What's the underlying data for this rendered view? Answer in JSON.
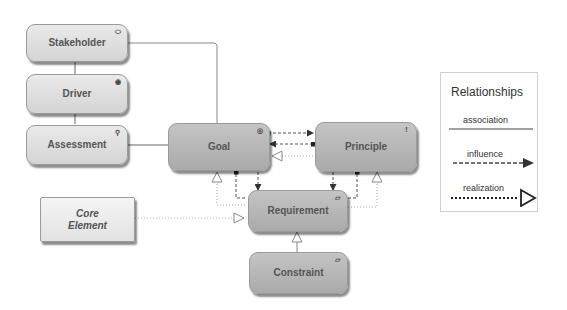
{
  "diagram": {
    "type": "ArchiMate motivation elements relationship diagram",
    "nodes": [
      {
        "id": "stakeholder",
        "label": "Stakeholder",
        "style": "light",
        "icon": "stakeholder-cylinder-icon"
      },
      {
        "id": "driver",
        "label": "Driver",
        "style": "light",
        "icon": "driver-wheel-icon"
      },
      {
        "id": "assessment",
        "label": "Assessment",
        "style": "light",
        "icon": "assessment-magnifier-icon"
      },
      {
        "id": "goal",
        "label": "Goal",
        "style": "dark",
        "icon": "goal-target-icon"
      },
      {
        "id": "principle",
        "label": "Principle",
        "style": "dark",
        "icon": "principle-exclamation-icon"
      },
      {
        "id": "requirement",
        "label": "Requirement",
        "style": "dark",
        "icon": "requirement-parallelogram-icon"
      },
      {
        "id": "constraint",
        "label": "Constraint",
        "style": "dark",
        "icon": "constraint-parallelogram-icon"
      },
      {
        "id": "core",
        "label_line1": "Core",
        "label_line2": "Element",
        "style": "core"
      }
    ],
    "edges": [
      {
        "from": "stakeholder",
        "to": "driver",
        "type": "association"
      },
      {
        "from": "driver",
        "to": "assessment",
        "type": "association"
      },
      {
        "from": "stakeholder",
        "to": "goal",
        "type": "association"
      },
      {
        "from": "assessment",
        "to": "goal",
        "type": "association"
      },
      {
        "from": "goal",
        "to": "principle",
        "type": "influence"
      },
      {
        "from": "principle",
        "to": "goal",
        "type": "influence"
      },
      {
        "from": "principle",
        "to": "goal",
        "type": "realization"
      },
      {
        "from": "requirement",
        "to": "goal",
        "type": "realization"
      },
      {
        "from": "requirement",
        "to": "goal",
        "type": "influence"
      },
      {
        "from": "goal",
        "to": "requirement",
        "type": "influence"
      },
      {
        "from": "principle",
        "to": "requirement",
        "type": "influence"
      },
      {
        "from": "requirement",
        "to": "principle",
        "type": "influence"
      },
      {
        "from": "requirement",
        "to": "principle",
        "type": "realization"
      },
      {
        "from": "core",
        "to": "requirement",
        "type": "realization"
      },
      {
        "from": "constraint",
        "to": "requirement",
        "type": "realization"
      }
    ]
  },
  "legend": {
    "title": "Relationships",
    "items": [
      {
        "label": "association",
        "line": "solid"
      },
      {
        "label": "influence",
        "line": "dashed",
        "head": "filled-arrow"
      },
      {
        "label": "realization",
        "line": "dotted",
        "head": "hollow-triangle"
      }
    ]
  },
  "badges": {
    "stakeholder": "⬭",
    "driver": "◉",
    "assessment": "⚲",
    "goal": "◎",
    "principle": "!",
    "requirement": "▱",
    "constraint": "▱"
  }
}
